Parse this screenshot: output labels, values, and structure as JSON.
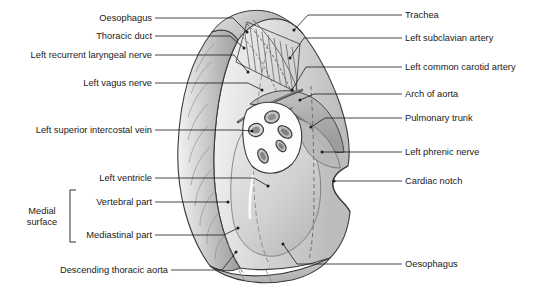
{
  "figure": {
    "background_color": "#ffffff",
    "line_color": "#1a1a1a",
    "text_color": "#1a1a1a",
    "fill_light": "#ebebeb",
    "fill_mid": "#c9c9c9",
    "fill_dark": "#a8a8a8",
    "fill_darker": "#8d8d8d",
    "hilum_white": "#fdfdfd"
  },
  "labels_left": [
    {
      "id": "oesophagus-superior",
      "text": "Oesophagus",
      "x": 152,
      "y": 18,
      "tip_x": 247,
      "tip_y": 32
    },
    {
      "id": "thoracic-duct",
      "text": "Thoracic duct",
      "x": 152,
      "y": 36,
      "tip_x": 244,
      "tip_y": 48
    },
    {
      "id": "left-recurrent-laryngeal-nerve",
      "text": "Left recurrent laryngeal nerve",
      "x": 152,
      "y": 55,
      "tip_x": 248,
      "tip_y": 72
    },
    {
      "id": "left-vagus-nerve",
      "text": "Left vagus nerve",
      "x": 152,
      "y": 83,
      "tip_x": 262,
      "tip_y": 90
    },
    {
      "id": "left-superior-intercostal-vein",
      "text": "Left superior intercostal vein",
      "x": 152,
      "y": 130,
      "tip_x": 252,
      "tip_y": 131
    },
    {
      "id": "left-ventricle",
      "text": "Left ventricle",
      "x": 152,
      "y": 178,
      "tip_x": 268,
      "tip_y": 186
    },
    {
      "id": "vertebral-part",
      "text": "Vertebral part",
      "x": 152,
      "y": 202,
      "tip_x": 228,
      "tip_y": 202
    },
    {
      "id": "mediastinal-part",
      "text": "Mediastinal part",
      "x": 152,
      "y": 235,
      "tip_x": 238,
      "tip_y": 228
    },
    {
      "id": "descending-thoracic-aorta",
      "text": "Descending thoracic aorta",
      "x": 168,
      "y": 270,
      "tip_x": 236,
      "tip_y": 252
    }
  ],
  "labels_right": [
    {
      "id": "trachea",
      "text": "Trachea",
      "x": 405,
      "y": 15,
      "tip_x": 294,
      "tip_y": 30
    },
    {
      "id": "left-subclavian-artery",
      "text": "Left subclavian artery",
      "x": 405,
      "y": 38,
      "tip_x": 290,
      "tip_y": 58
    },
    {
      "id": "left-common-carotid-artery",
      "text": "Left common carotid artery",
      "x": 405,
      "y": 67,
      "tip_x": 292,
      "tip_y": 90
    },
    {
      "id": "arch-of-aorta",
      "text": "Arch of aorta",
      "x": 405,
      "y": 94,
      "tip_x": 300,
      "tip_y": 100
    },
    {
      "id": "pulmonary-trunk",
      "text": "Pulmonary trunk",
      "x": 405,
      "y": 118,
      "tip_x": 311,
      "tip_y": 127
    },
    {
      "id": "left-phrenic-nerve",
      "text": "Left phrenic nerve",
      "x": 405,
      "y": 152,
      "tip_x": 322,
      "tip_y": 152
    },
    {
      "id": "cardiac-notch",
      "text": "Cardiac notch",
      "x": 405,
      "y": 181,
      "tip_x": 334,
      "tip_y": 181
    },
    {
      "id": "oesophagus-inferior",
      "text": "Oesophagus",
      "x": 405,
      "y": 264,
      "tip_x": 283,
      "tip_y": 244
    }
  ],
  "bracket": {
    "id": "medial-surface-bracket",
    "label_line_1": "Medial",
    "label_line_2": "surface",
    "label_x": 42,
    "label_y": 217,
    "x": 70,
    "y_top": 190,
    "y_bottom": 242,
    "tick": 6
  },
  "anatomy": {
    "regions": [
      "lung-apex",
      "costal-surface-rib-impressions",
      "groove-for-oesophagus",
      "groove-for-subclavian-artery",
      "groove-for-aortic-arch",
      "hilum",
      "cardiac-impression",
      "cardiac-notch",
      "lung-base",
      "oblique-fissure"
    ],
    "hilum_structures": [
      "left-principal-bronchus",
      "left-pulmonary-artery",
      "superior-pulmonary-vein",
      "inferior-pulmonary-vein",
      "bronchopulmonary-lymph-node"
    ]
  }
}
